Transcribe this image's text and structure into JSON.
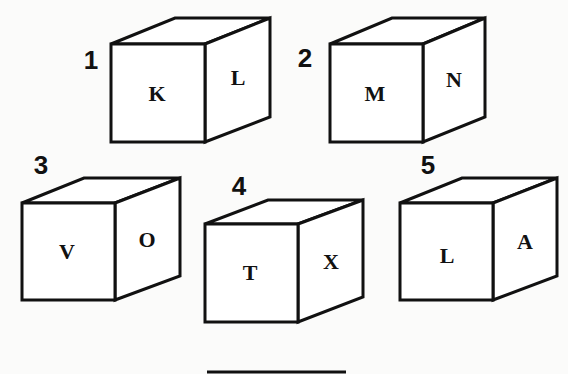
{
  "cubes": [
    {
      "number": "1",
      "front": "K",
      "side": "L"
    },
    {
      "number": "2",
      "front": "M",
      "side": "N"
    },
    {
      "number": "3",
      "front": "V",
      "side": "O"
    },
    {
      "number": "4",
      "front": "T",
      "side": "X"
    },
    {
      "number": "5",
      "front": "L",
      "side": "A"
    }
  ]
}
